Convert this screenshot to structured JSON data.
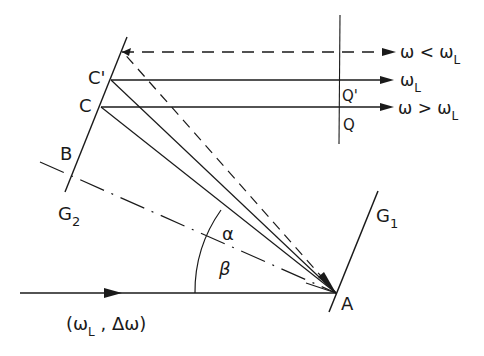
{
  "diagram": {
    "type": "optical grating double-pass geometry",
    "points": {
      "A": "A",
      "B": "B",
      "C": "C",
      "C_prime": "C'",
      "Q": "Q",
      "Q_prime": "Q'"
    },
    "gratings": {
      "g1": "G",
      "g1_sub": "1",
      "g2": "G",
      "g2_sub": "2"
    },
    "angles": {
      "alpha": "α",
      "beta": "β"
    },
    "input_beam": {
      "label_open": "(ω",
      "label_sub": "L",
      "label_rest": " , Δω)"
    },
    "output_beams": [
      {
        "style": "dashed",
        "label_main": "ω < ω",
        "label_sub": "L"
      },
      {
        "style": "solid",
        "label_main": "ω",
        "label_sub": "L"
      },
      {
        "style": "solid",
        "label_main": "ω > ω",
        "label_sub": "L"
      }
    ]
  }
}
